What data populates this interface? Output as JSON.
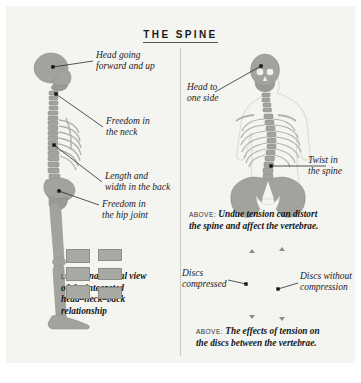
{
  "title": "THE SPINE",
  "colors": {
    "panel_bg": "#f4f4f1",
    "bone": "#a3a39d",
    "bone_dark": "#8b8b85",
    "divider": "#c9c9c4",
    "text": "#1a1a1a",
    "body_outline": "#d8d8d3"
  },
  "left_panel": {
    "labels": [
      {
        "id": "head",
        "line1": "Head going",
        "line2": "forward and up"
      },
      {
        "id": "neck",
        "line1": "Freedom in",
        "line2": "the neck"
      },
      {
        "id": "back",
        "line1": "Length and",
        "line2": "width in the back"
      },
      {
        "id": "hip",
        "line1": "Freedom in",
        "line2": "the hip joint"
      }
    ],
    "caption": {
      "lead": "LEFT:",
      "line1": "Anatomical view",
      "line2": "of the integrated",
      "line3": "head–neck–back",
      "line4": "relationship"
    }
  },
  "right_panel": {
    "labels": [
      {
        "id": "head-side",
        "line1": "Head to",
        "line2": "one side"
      },
      {
        "id": "twist",
        "line1": "Twist in",
        "line2": "the spine"
      }
    ],
    "caption_top": {
      "lead": "ABOVE:",
      "line1": "Undue tension can distort",
      "line2": "the spine and affect the vertebrae."
    },
    "discs": {
      "label_left": {
        "line1": "Discs",
        "line2": "compressed"
      },
      "label_right": {
        "line1": "Discs without",
        "line2": "compression"
      },
      "compressed_blocks": 3,
      "uncompressed_blocks": 3
    },
    "caption_bottom": {
      "lead": "ABOVE:",
      "line1": "The effects of tension on",
      "line2": "the discs between the vertebrae."
    }
  }
}
